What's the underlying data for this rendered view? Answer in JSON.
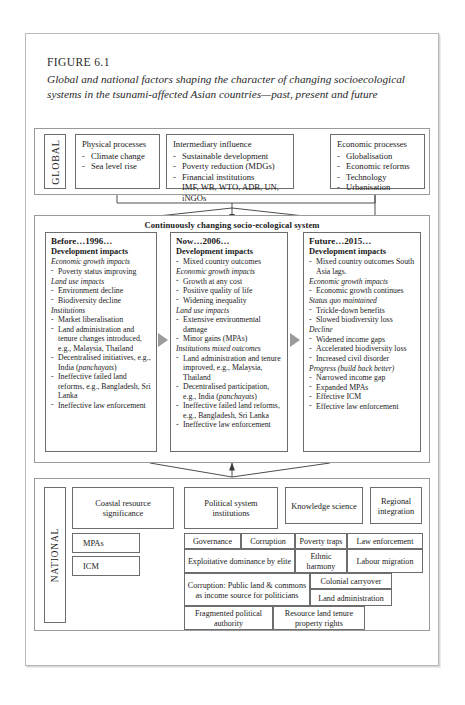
{
  "figure": {
    "label": "FIGURE 6.1",
    "title": "Global and national factors shaping the character of changing socioecological systems in the tsunami-affected Asian countries—past, present and future"
  },
  "global": {
    "band_label": "GLOBAL",
    "columns": [
      {
        "name": "physical-processes",
        "heading": "Physical processes",
        "items": [
          "Climate change",
          "Sea level rise"
        ]
      },
      {
        "name": "intermediary-influence",
        "heading": "Intermediary influence",
        "items": [
          "Sustainable development",
          "Poverty reduction (MDGs)",
          "Financial institutions"
        ],
        "continuation": "IMF, WB, WTO, ADB, UN, iNGOs"
      },
      {
        "name": "economic-processes",
        "heading": "Economic processes",
        "items": [
          "Globalisation",
          "Economic reforms",
          "Technology",
          "Urbanisation"
        ]
      }
    ]
  },
  "middle": {
    "band_title": "Continuously changing socio-ecological system",
    "periods": [
      {
        "name": "before-1996",
        "title": "Before…1996…",
        "subtitle": "Development impacts",
        "blocks": [
          {
            "heading": "Economic growth impacts",
            "items": [
              "Poverty status improving"
            ]
          },
          {
            "heading": "Land use impacts",
            "items": [
              "Environment decline",
              "Biodiversity decline"
            ]
          },
          {
            "heading": "Institutions",
            "items": [
              "Market liberalisation",
              "Land administration and tenure changes introduced, e.g., Malaysia, Thailand",
              "Decentralised initiatives, e.g., India (panchayats)",
              "Ineffective failed land reforms, e.g., Bangladesh, Sri Lanka",
              "Ineffective law enforcement"
            ]
          }
        ]
      },
      {
        "name": "now-2006",
        "title": "Now…2006…",
        "subtitle": "Development impacts",
        "lead_items": [
          "Mixed country outcomes"
        ],
        "blocks": [
          {
            "heading": "Economic growth impacts",
            "items": [
              "Growth at any cost",
              "Positive quality of life",
              "Widening inequality"
            ]
          },
          {
            "heading": "Land use impacts",
            "items": [
              "Extensive environmental damage",
              "Minor gains (MPAs)"
            ]
          },
          {
            "heading": "Institutions mixed outcomes",
            "items": [
              "Land administration and tenure improved, e.g., Malaysia, Thailand",
              "Decentralised participation, e.g., India (panchayats)",
              "Ineffective failed land reforms, e.g., Bangladesh, Sri Lanka",
              "Ineffective law enforcement"
            ]
          }
        ]
      },
      {
        "name": "future-2015",
        "title": "Future…2015…",
        "subtitle": "Development impacts",
        "lead_items": [
          "Mixed country outcomes South Asia lags."
        ],
        "blocks": [
          {
            "heading": "Economic growth impacts",
            "items": [
              "Economic growth continues"
            ]
          },
          {
            "heading": "Status quo maintained",
            "items": [
              "Trickle-down benefits",
              "Slowed biodiversity loss"
            ]
          },
          {
            "heading": "Decline",
            "items": [
              "Widened income gaps",
              "Accelerated biodiversity loss",
              "Increased civil disorder"
            ]
          },
          {
            "heading": "Progress (build back better)",
            "items": [
              "Narrowed income gap",
              "Expanded MPAs",
              "Effective ICM",
              "Effective law enforcement"
            ]
          }
        ]
      }
    ]
  },
  "national": {
    "band_label": "NATIONAL",
    "coastal": {
      "title": "Coastal resource significance",
      "sub": [
        "MPAs",
        "ICM"
      ]
    },
    "political": {
      "title": "Political system institutions"
    },
    "knowledge": {
      "title": "Knowledge science"
    },
    "regional": {
      "title": "Regional integration"
    },
    "political_cells": [
      "Governance",
      "Corruption",
      "Poverty traps",
      "Law enforcement",
      "Exploitative dominance by elite",
      "Ethnic harmony",
      "Labour migration",
      "Corruption: Public land & commons as income source for politicians",
      "Colonial carryover",
      "Land administration",
      "Fragmented political authority",
      "Resource land tenure property rights"
    ]
  },
  "colors": {
    "box_border": "#6d6d6d",
    "page_border": "#b9b9b9",
    "arrow_gray": "#9b9b9b",
    "connector": "#3a3a3a",
    "text": "#1a1a1a"
  }
}
